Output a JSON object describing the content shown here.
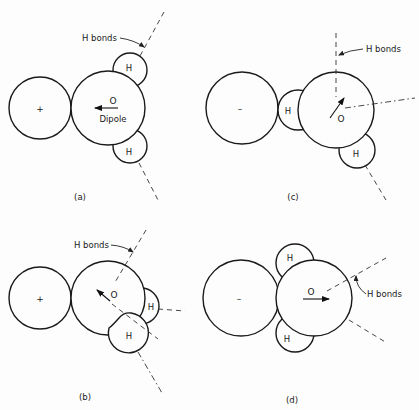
{
  "labels": {
    "h_bonds": "H bonds",
    "dipole": "Dipole",
    "oxygen": "O",
    "hydrogen": "H",
    "positive_ion": "+",
    "negative_ion": "–"
  },
  "panels": [
    {
      "id": "a",
      "caption": "(a)",
      "ion_charge": "+"
    },
    {
      "id": "b",
      "caption": "(b)",
      "ion_charge": "+"
    },
    {
      "id": "c",
      "caption": "(c)",
      "ion_charge": "–"
    },
    {
      "id": "d",
      "caption": "(d)",
      "ion_charge": "–"
    }
  ]
}
